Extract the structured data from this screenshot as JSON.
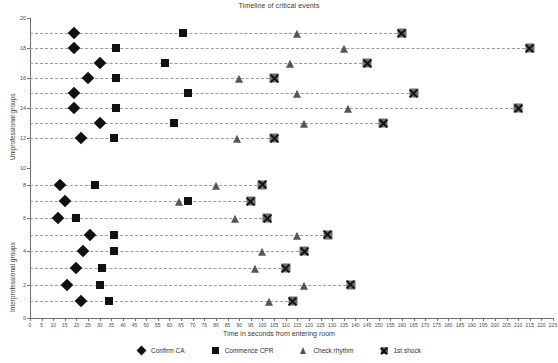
{
  "chart_data": {
    "type": "scatter",
    "title": "Timeline of critical events",
    "xlabel": "Time in seconds from entering room",
    "xlim": [
      0,
      225
    ],
    "xticks": [
      0,
      5,
      10,
      15,
      20,
      25,
      30,
      35,
      40,
      45,
      50,
      55,
      60,
      65,
      70,
      75,
      80,
      85,
      90,
      95,
      100,
      105,
      110,
      115,
      120,
      125,
      130,
      135,
      140,
      145,
      150,
      155,
      160,
      165,
      170,
      175,
      180,
      185,
      190,
      195,
      200,
      205,
      210,
      215,
      220,
      225
    ],
    "grid": false,
    "legend_position": "bottom",
    "legend": [
      {
        "label": "Confirm CA",
        "marker": "diamond",
        "color": "#111111"
      },
      {
        "label": "Commence CPR",
        "marker": "square",
        "color": "#111111"
      },
      {
        "label": "Check rhythm",
        "marker": "triangle",
        "color": "#565656"
      },
      {
        "label": "1st shock",
        "marker": "square-x",
        "color": "#6d6d6d"
      }
    ],
    "panels": [
      {
        "id": "upper",
        "ylabel": "Uniprofessional groups",
        "ylim": [
          10,
          20
        ],
        "yticks": [
          10,
          12,
          14,
          16,
          18,
          20
        ],
        "rows": [
          {
            "group": 19,
            "confirm_ca": 19,
            "commence_cpr": 66,
            "check_rhythm": 115,
            "first_shock": 160
          },
          {
            "group": 18,
            "confirm_ca": 19,
            "commence_cpr": 37,
            "check_rhythm": 135,
            "first_shock": 215
          },
          {
            "group": 17,
            "confirm_ca": 30,
            "commence_cpr": 58,
            "check_rhythm": 112,
            "first_shock": 145
          },
          {
            "group": 16,
            "confirm_ca": 25,
            "commence_cpr": 37,
            "check_rhythm": 90,
            "first_shock": 105
          },
          {
            "group": 15,
            "confirm_ca": 19,
            "commence_cpr": 68,
            "check_rhythm": 115,
            "first_shock": 165
          },
          {
            "group": 14,
            "confirm_ca": 19,
            "commence_cpr": 37,
            "check_rhythm": 137,
            "first_shock": 210
          },
          {
            "group": 13,
            "confirm_ca": 30,
            "commence_cpr": 62,
            "check_rhythm": 118,
            "first_shock": 152
          },
          {
            "group": 12,
            "confirm_ca": 22,
            "commence_cpr": 36,
            "check_rhythm": 89,
            "first_shock": 105
          }
        ]
      },
      {
        "id": "lower",
        "ylabel": "Interprofessional groups",
        "ylim": [
          0,
          9
        ],
        "yticks": [
          0,
          2,
          4,
          6,
          8
        ],
        "rows": [
          {
            "group": 8,
            "confirm_ca": 13,
            "commence_cpr": 28,
            "check_rhythm": 80,
            "first_shock": 100
          },
          {
            "group": 7,
            "confirm_ca": 15,
            "commence_cpr": 68,
            "check_rhythm": 64,
            "first_shock": 95
          },
          {
            "group": 6,
            "confirm_ca": 12,
            "commence_cpr": 20,
            "check_rhythm": 88,
            "first_shock": 102
          },
          {
            "group": 5,
            "confirm_ca": 26,
            "commence_cpr": 36,
            "check_rhythm": 115,
            "first_shock": 128
          },
          {
            "group": 4,
            "confirm_ca": 23,
            "commence_cpr": 36,
            "check_rhythm": 100,
            "first_shock": 118
          },
          {
            "group": 3,
            "confirm_ca": 20,
            "commence_cpr": 31,
            "check_rhythm": 97,
            "first_shock": 110
          },
          {
            "group": 2,
            "confirm_ca": 16,
            "commence_cpr": 30,
            "check_rhythm": 118,
            "first_shock": 138
          },
          {
            "group": 1,
            "confirm_ca": 22,
            "commence_cpr": 34,
            "check_rhythm": 103,
            "first_shock": 113
          }
        ]
      }
    ]
  }
}
